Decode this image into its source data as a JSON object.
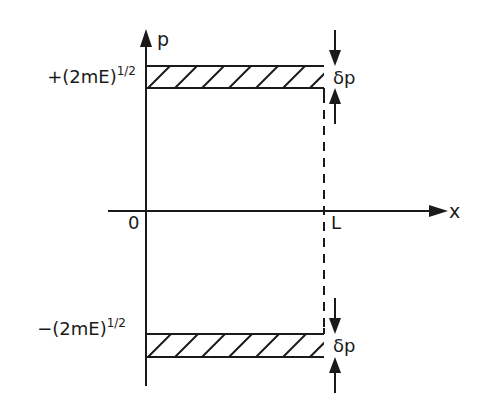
{
  "diagram": {
    "type": "phase-space",
    "axes": {
      "vertical_label": "p",
      "horizontal_label": "x",
      "origin_label": "0",
      "x_mark_label": "L"
    },
    "bands": [
      {
        "name": "upper",
        "label_base": "+(2mE)",
        "label_exponent": "1/2",
        "width_label": "δp"
      },
      {
        "name": "lower",
        "label_base": "−(2mE)",
        "label_exponent": "1/2",
        "width_label": "δp"
      }
    ],
    "colors": {
      "stroke": "#1a1a1a",
      "background": "#ffffff"
    }
  }
}
